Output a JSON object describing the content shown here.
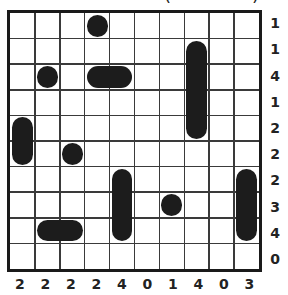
{
  "puzzle": {
    "type": "battleship",
    "rows": 10,
    "cols": 10,
    "title_fragment": [
      "(",
      ")"
    ],
    "row_clues": [
      "1",
      "1",
      "4",
      "1",
      "2",
      "2",
      "2",
      "3",
      "4",
      "0"
    ],
    "col_clues": [
      "2",
      "2",
      "2",
      "2",
      "4",
      "0",
      "1",
      "4",
      "0",
      "3"
    ],
    "ships": [
      {
        "row": 0,
        "col": 3,
        "length": 1,
        "orientation": "single"
      },
      {
        "row": 1,
        "col": 7,
        "length": 4,
        "orientation": "vertical"
      },
      {
        "row": 2,
        "col": 1,
        "length": 1,
        "orientation": "single"
      },
      {
        "row": 2,
        "col": 3,
        "length": 2,
        "orientation": "horizontal"
      },
      {
        "row": 4,
        "col": 0,
        "length": 2,
        "orientation": "vertical"
      },
      {
        "row": 5,
        "col": 2,
        "length": 1,
        "orientation": "single"
      },
      {
        "row": 6,
        "col": 4,
        "length": 3,
        "orientation": "vertical"
      },
      {
        "row": 6,
        "col": 9,
        "length": 3,
        "orientation": "vertical"
      },
      {
        "row": 7,
        "col": 6,
        "length": 1,
        "orientation": "single"
      },
      {
        "row": 8,
        "col": 1,
        "length": 2,
        "orientation": "horizontal"
      }
    ],
    "colors": {
      "ship": "#1c1c1c",
      "grid": "#3a3a3a",
      "border": "#1a1a1a",
      "background": "#ffffff"
    }
  }
}
